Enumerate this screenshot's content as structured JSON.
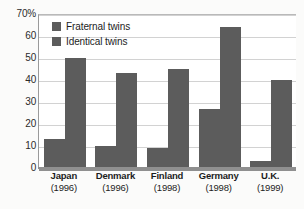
{
  "chart_data": {
    "type": "bar",
    "title": "",
    "xlabel": "",
    "ylabel": "",
    "ylim": [
      0,
      70
    ],
    "grid": true,
    "legend_position": "top-left",
    "categories": [
      "Japan",
      "Denmark",
      "Finland",
      "Germany",
      "U.K."
    ],
    "category_years": [
      "(1996)",
      "(1996)",
      "(1998)",
      "(1998)",
      "(1999)"
    ],
    "ytick_labels": [
      "70%",
      "60",
      "50",
      "40",
      "30",
      "20",
      "10",
      "0"
    ],
    "ytick_values": [
      70,
      60,
      50,
      40,
      30,
      20,
      10,
      0
    ],
    "series": [
      {
        "name": "Fraternal twins",
        "color": "#5c5c5c",
        "values": [
          13,
          10,
          9,
          27,
          3
        ]
      },
      {
        "name": "Identical twins",
        "color": "#5c5c5c",
        "values": [
          50,
          43,
          45,
          64,
          40
        ]
      }
    ]
  },
  "legend": {
    "items": [
      {
        "label": "Fraternal twins",
        "color": "#5c5c5c"
      },
      {
        "label": "Identical twins",
        "color": "#5c5c5c"
      }
    ]
  },
  "colors": {
    "bar": "#5c5c5c",
    "gridline": "#d2d2d2",
    "axis": "#8f8f8f",
    "plot_background": "#ffffff",
    "page_background": "#fbfbfa",
    "text": "#1d1d1d"
  }
}
